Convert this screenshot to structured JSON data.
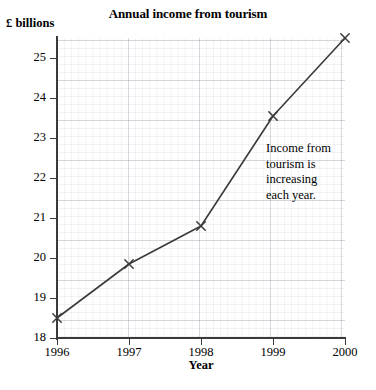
{
  "chart_data": {
    "type": "line",
    "title": "Annual income from tourism",
    "xlabel": "Year",
    "ylabel": "£ billions",
    "categories": [
      "1996",
      "1997",
      "1998",
      "1999",
      "2000"
    ],
    "x": [
      1996,
      1997,
      1998,
      1999,
      2000
    ],
    "values": [
      18.5,
      19.85,
      20.8,
      23.55,
      25.5
    ],
    "series": [
      {
        "name": "Income from tourism",
        "values": [
          18.5,
          19.85,
          20.8,
          23.55,
          25.5
        ]
      }
    ],
    "xlim": [
      1996,
      2000
    ],
    "ylim": [
      18,
      25.5
    ],
    "ytick_labels": [
      "18",
      "19",
      "20",
      "21",
      "22",
      "23",
      "24",
      "25"
    ],
    "ytick_values": [
      18,
      19,
      20,
      21,
      22,
      23,
      24,
      25
    ],
    "xtick_labels": [
      "1996",
      "1997",
      "1998",
      "1999",
      "2000"
    ],
    "grid": true,
    "minor_grid": true,
    "legend": "none",
    "marker": "x",
    "line_color": "#3a3a3a",
    "grid_color": "#8c96a5",
    "annotations": [
      {
        "name": "income-increasing-note",
        "lines": [
          "Income from",
          "tourism is",
          "increasing",
          "each year."
        ]
      }
    ]
  },
  "colors": {
    "axis": "#3a3a3a",
    "line": "#3a3a3a",
    "grid_major": "#8c96a5",
    "grid_minor": "#96a0af",
    "background": "#ffffff",
    "text": "#000000"
  }
}
